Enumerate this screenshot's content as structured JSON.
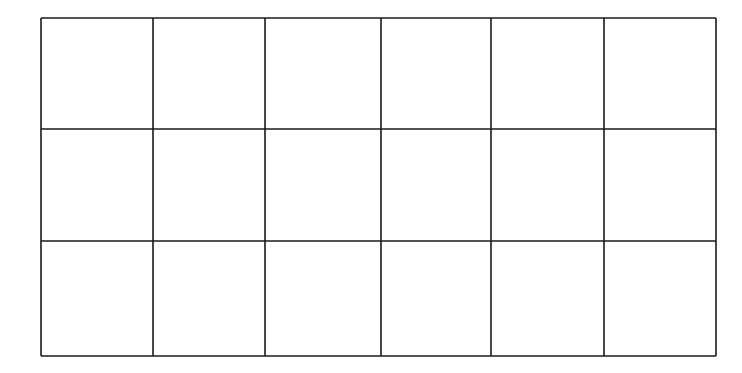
{
  "diagram": {
    "type": "empty-grid",
    "rows": 3,
    "columns": 6,
    "line_color": "#1a1a1a",
    "background": "#ffffff",
    "column_edges_px": [
      41,
      153,
      265,
      381,
      491,
      604,
      716
    ],
    "row_edges_px": [
      18,
      129,
      241,
      356
    ],
    "cells": [
      [
        "",
        "",
        "",
        "",
        "",
        ""
      ],
      [
        "",
        "",
        "",
        "",
        "",
        ""
      ],
      [
        "",
        "",
        "",
        "",
        "",
        ""
      ]
    ]
  }
}
